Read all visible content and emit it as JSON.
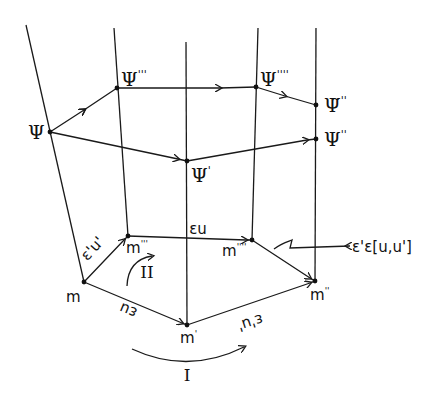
{
  "diagram": {
    "type": "commutative transport diagram",
    "nodes": {
      "psi": {
        "label": "Ψ",
        "sup": "",
        "x": 50,
        "y": 132
      },
      "psi3": {
        "label": "Ψ",
        "sup": "'''",
        "x": 117,
        "y": 88
      },
      "psi4": {
        "label": "Ψ",
        "sup": "''''",
        "x": 256,
        "y": 87
      },
      "psi_tilde2": {
        "label": "Ψ̃",
        "sup": "''",
        "x": 316,
        "y": 105
      },
      "psi1": {
        "label": "Ψ",
        "sup": "'",
        "x": 187,
        "y": 161
      },
      "psi2": {
        "label": "Ψ",
        "sup": "''",
        "x": 316,
        "y": 139
      },
      "m": {
        "label": "m",
        "sup": "",
        "x": 84,
        "y": 282
      },
      "m3": {
        "label": "m",
        "sup": "'''",
        "x": 128,
        "y": 236
      },
      "m4": {
        "label": "m",
        "sup": "''''",
        "x": 252,
        "y": 240
      },
      "m1": {
        "label": "m",
        "sup": "'",
        "x": 187,
        "y": 325
      },
      "m2": {
        "label": "m",
        "sup": "''",
        "x": 315,
        "y": 281
      }
    },
    "edge_labels": {
      "m_to_m1": "εu",
      "m1_to_m2": "ε'u'",
      "m_to_m3": "ε'u'",
      "m3_to_m4": "εu",
      "commutator": "ε'ε[u,u']"
    },
    "loops": {
      "loop1": "I",
      "loop2": "II"
    }
  }
}
